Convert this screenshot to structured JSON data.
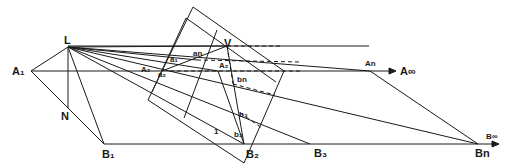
{
  "figure": {
    "points": {
      "L": {
        "label": "L",
        "x": 68,
        "y": 47
      },
      "A1": {
        "label": "A₁",
        "x": 31,
        "y": 71
      },
      "N": {
        "label": "N",
        "x": 68,
        "y": 108
      },
      "B1": {
        "label": "B₁",
        "x": 104,
        "y": 144
      },
      "V": {
        "label": "V",
        "x": 227,
        "y": 46
      },
      "A2": {
        "label": "A₂",
        "x": 218,
        "y": 71
      },
      "B2": {
        "label": "B₂",
        "x": 244,
        "y": 144
      },
      "B3": {
        "label": "B₃",
        "x": 310,
        "y": 144
      },
      "Bn": {
        "label": "Bn",
        "x": 478,
        "y": 144
      },
      "An": {
        "label": "An",
        "x": 370,
        "y": 71
      }
    },
    "labels": {
      "L": "L",
      "A1": "A₁",
      "N": "N",
      "B1": "B₁",
      "V": "V",
      "A2": "A₂",
      "B2": "B₂",
      "B3": "B₃",
      "Bn": "Bn",
      "An": "An",
      "A_inf": "A∞",
      "B_inf": "B∞",
      "a_n": "an",
      "a_1": "a₁",
      "a_2": "a₂",
      "A_small": "A₂",
      "b_n": "bn",
      "b_3": "b₃",
      "b_2": "b₂",
      "one": "1"
    }
  }
}
